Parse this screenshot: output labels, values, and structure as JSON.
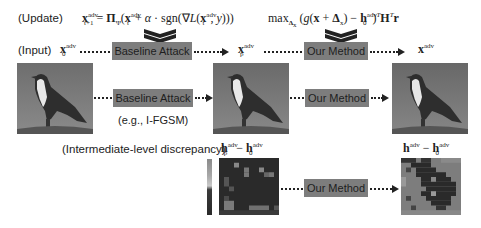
{
  "update_row": {
    "label": "(Update)",
    "baseline_formula": "x_{t+1}^{adv} = Π_Ψ(x_t^{adv} + α · sgn(∇L(x_t^{adv}, y)))",
    "ours_formula": "max_{Δx} (g(x + Δx) − h_0^{adv})^T H^T r"
  },
  "input_row": {
    "label": "(Input)",
    "input_symbol": "x_0^{adv}",
    "baseline_box": "Baseline Attack",
    "intermediate_symbol": "x_p^{adv}",
    "method_box": "Our Method",
    "output_symbol": "x^{adv}"
  },
  "image_row": {
    "baseline_box": "Baseline Attack",
    "baseline_example": "(e.g., I-FGSM)",
    "method_box": "Our Method"
  },
  "discrepancy_row": {
    "label": "(Intermediate-level discrepancy)",
    "left_title": "h_p^{adv} − h_0^{adv}",
    "right_title": "h^{adv} − h_0^{adv}",
    "method_box": "Our Method"
  },
  "colors": {
    "box_fill": "#7d7d7d",
    "text": "#222222",
    "background": "#ffffff"
  }
}
